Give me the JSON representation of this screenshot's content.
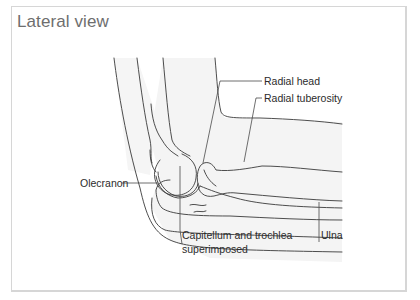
{
  "title": "Lateral view",
  "labels": {
    "radial_head": "Radial head",
    "radial_tuberosity": "Radial tuberosity",
    "olecranon": "Olecranon",
    "capitellum_line1": "Capitellum and trochlea",
    "capitellum_line2": "superimposed",
    "ulna": "Ulna"
  },
  "colors": {
    "line": "#3a3a3a",
    "leader": "#4a4a4a",
    "fill": "#f4f4f4",
    "border": "#d6d6d6",
    "title": "#6e6e6e"
  }
}
